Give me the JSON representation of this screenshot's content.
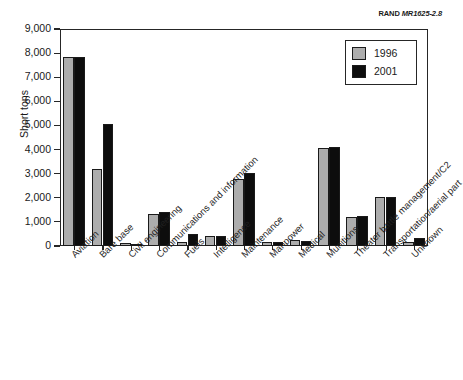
{
  "source_tag": {
    "org": "RAND",
    "number": "MR1625-2.8"
  },
  "chart_data": {
    "type": "bar",
    "title": "",
    "xlabel": "",
    "ylabel": "Short tons",
    "ylim": [
      0,
      9000
    ],
    "yticks": [
      "0",
      "1,000",
      "2,000",
      "3,000",
      "4,000",
      "5,000",
      "6,000",
      "7,000",
      "8,000",
      "9,000"
    ],
    "ytick_values": [
      0,
      1000,
      2000,
      3000,
      4000,
      5000,
      6000,
      7000,
      8000,
      9000
    ],
    "grid": false,
    "legend_position": "upper right",
    "categories": [
      "Aviation",
      "Bare base",
      "Civil engineering",
      "Communications and information",
      "Fuels",
      "Intelligence",
      "Maintenance",
      "Manpower",
      "Medical",
      "Munitions",
      "Theater battle management/C2",
      "Transportation/aerial part",
      "Unknown"
    ],
    "series": [
      {
        "name": "1996",
        "color": "#adadad",
        "values": [
          7850,
          3210,
          130,
          1330,
          180,
          430,
          2780,
          185,
          260,
          4050,
          1190,
          2030,
          170
        ]
      },
      {
        "name": "2001",
        "color": "#0d0d0d",
        "values": [
          7860,
          5060,
          50,
          1430,
          500,
          420,
          3030,
          185,
          215,
          4120,
          1240,
          2040,
          330
        ]
      }
    ]
  }
}
